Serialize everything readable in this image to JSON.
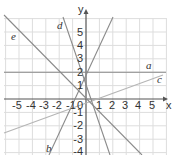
{
  "diagram": {
    "title": "",
    "axes": {
      "x_label": "x",
      "y_label": "y",
      "x_ticks": [
        "-5",
        "-4",
        "-3",
        "-2",
        "-1",
        "0",
        "1",
        "2",
        "3",
        "4",
        "5"
      ],
      "y_ticks": [
        "5",
        "4",
        "3",
        "2",
        "1",
        "-1",
        "-2",
        "-3",
        "-4"
      ],
      "origin_label": "0",
      "x_range": [
        -6,
        6
      ],
      "y_range": [
        -4.5,
        6
      ]
    },
    "lines": [
      {
        "name": "a",
        "label": "a",
        "description": "horizontal line y = 2",
        "color": "#8a8a8a"
      },
      {
        "name": "b",
        "label": "b",
        "description": "steep line through (0,1) rising to right",
        "color": "#8a8a8a"
      },
      {
        "name": "c",
        "label": "c",
        "description": "shallow line rising to right",
        "color": "#b5b5b5"
      },
      {
        "name": "d",
        "label": "d",
        "description": "steep line falling to right",
        "color": "#8a8a8a"
      },
      {
        "name": "e",
        "label": "e",
        "description": "line with slope -1 falling to right",
        "color": "#8a8a8a"
      }
    ],
    "colors": {
      "grid": "#dddddd",
      "axis": "#555555",
      "lines": "#8a8a8a"
    }
  }
}
